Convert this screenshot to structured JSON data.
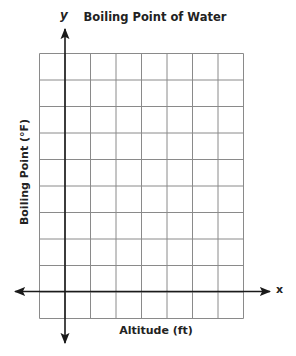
{
  "chart_data": {
    "type": "line",
    "title": "Boiling Point of Water",
    "xlabel": "Altitude (ft)",
    "ylabel": "Boiling Point (°F)",
    "x_axis_variable": "x",
    "y_axis_variable": "y",
    "series": [],
    "grid": {
      "on": true,
      "columns": 8,
      "rows": 10,
      "line_color": "#8a8a8a"
    },
    "axes": {
      "color": "#1a1a1a",
      "x_axis_row_from_bottom": 1,
      "y_axis_column_from_left": 1,
      "arrows": true
    },
    "tick_labels": {
      "x": [],
      "y": []
    },
    "legend": null
  }
}
